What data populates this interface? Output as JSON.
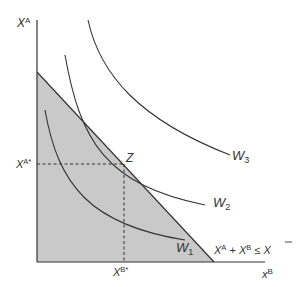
{
  "diagram": {
    "axes": {
      "y_label": {
        "main": "X",
        "sup": "A"
      },
      "x_label": {
        "main": "x",
        "sup": "B"
      }
    },
    "markers": {
      "x_a_star": {
        "main": "X",
        "sup": "A*"
      },
      "x_b_star": {
        "main": "X",
        "sup": "B*"
      },
      "point_z": "Z"
    },
    "curves": [
      {
        "id": "W3",
        "main": "W",
        "sub": "3"
      },
      {
        "id": "W2",
        "main": "W",
        "sub": "2"
      },
      {
        "id": "W1",
        "main": "W",
        "sub": "1"
      }
    ],
    "constraint": {
      "label_parts": {
        "xa": "X",
        "xa_sup": "A",
        "plus": " + ",
        "xb": "X",
        "xb_sup": "B",
        "leq": " ≤ ",
        "xbar": "X"
      }
    },
    "colors": {
      "feasible_region_fill": "#c9c9c9",
      "line_color": "#333333",
      "background": "#ffffff"
    }
  }
}
